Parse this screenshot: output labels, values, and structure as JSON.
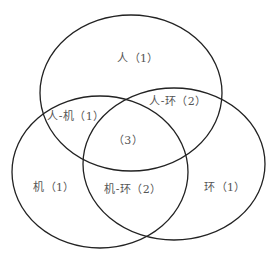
{
  "diagram": {
    "type": "venn",
    "stroke_color": "#222222",
    "text_color": "#555555",
    "sets": [
      {
        "id": "ren",
        "name": "人",
        "cx": 131,
        "cy": 93,
        "rx": 91,
        "ry": 78
      },
      {
        "id": "ji",
        "name": "机",
        "cx": 100,
        "cy": 172,
        "rx": 88,
        "ry": 76
      },
      {
        "id": "huan",
        "name": "环",
        "cx": 174,
        "cy": 164,
        "rx": 91,
        "ry": 76
      }
    ],
    "regions": [
      {
        "id": "ren-only",
        "label": "人（1）",
        "x": 138,
        "y": 57
      },
      {
        "id": "ren-ji",
        "label": "人-机（1）",
        "x": 76,
        "y": 115
      },
      {
        "id": "ren-huan",
        "label": "人-环（2）",
        "x": 178,
        "y": 100
      },
      {
        "id": "all-three",
        "label": "（3）",
        "x": 128,
        "y": 139
      },
      {
        "id": "ji-only",
        "label": "机（1）",
        "x": 54,
        "y": 186
      },
      {
        "id": "ji-huan",
        "label": "机-环（2）",
        "x": 133,
        "y": 188
      },
      {
        "id": "huan-only",
        "label": "环（1）",
        "x": 225,
        "y": 186
      }
    ]
  }
}
